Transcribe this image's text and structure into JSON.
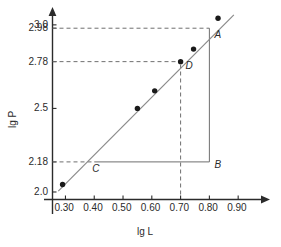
{
  "chart_data": {
    "type": "scatter",
    "title": "",
    "xlabel": "lg L",
    "ylabel": "lg P",
    "xlim": [
      0.255,
      0.955
    ],
    "ylim": [
      1.955,
      3.065
    ],
    "grid": false,
    "legend": null,
    "xticks": [
      "0.30",
      "0.40",
      "0.50",
      "0.60",
      "0.70",
      "0.80",
      "0.90"
    ],
    "xtick_values": [
      0.3,
      0.4,
      0.5,
      0.6,
      0.7,
      0.8,
      0.9
    ],
    "yticks": [
      "2.0",
      "2.18",
      "2.5",
      "2.78",
      "2.98",
      "3.0"
    ],
    "ytick_values": [
      2.0,
      2.18,
      2.5,
      2.78,
      2.98,
      3.0
    ],
    "points": [
      {
        "x": 0.29,
        "y": 2.045
      },
      {
        "x": 0.55,
        "y": 2.5
      },
      {
        "x": 0.61,
        "y": 2.605
      },
      {
        "x": 0.7,
        "y": 2.78
      },
      {
        "x": 0.745,
        "y": 2.855
      },
      {
        "x": 0.83,
        "y": 3.04
      }
    ],
    "fit_line": {
      "x0": 0.275,
      "y0": 2.005,
      "x1": 0.885,
      "y1": 3.06
    },
    "annotations": [
      {
        "label": "A",
        "x": 0.8,
        "y": 2.98
      },
      {
        "label": "B",
        "x": 0.8,
        "y": 2.18
      },
      {
        "label": "C",
        "x": 0.4,
        "y": 2.18
      },
      {
        "label": "D",
        "x": 0.7,
        "y": 2.78
      }
    ],
    "guides": [
      {
        "name": "dashed-hline-298",
        "from": [
          0.255,
          2.98
        ],
        "to": [
          0.8,
          2.98
        ],
        "style": "dashed"
      },
      {
        "name": "dashed-hline-278",
        "from": [
          0.255,
          2.78
        ],
        "to": [
          0.7,
          2.78
        ],
        "style": "dashed"
      },
      {
        "name": "dashed-hline-218",
        "from": [
          0.255,
          2.18
        ],
        "to": [
          0.4,
          2.18
        ],
        "style": "dashed"
      },
      {
        "name": "dashed-vline-070",
        "from": [
          0.7,
          1.985
        ],
        "to": [
          0.7,
          2.78
        ],
        "style": "dashed"
      },
      {
        "name": "solid-hline-CB",
        "from": [
          0.4,
          2.18
        ],
        "to": [
          0.8,
          2.18
        ],
        "style": "solid"
      },
      {
        "name": "solid-vline-BA",
        "from": [
          0.8,
          2.18
        ],
        "to": [
          0.8,
          2.98
        ],
        "style": "solid"
      }
    ]
  },
  "colors": {
    "axis": "#2b2b2b",
    "point": "#1a1a1a",
    "fit_line": "#8a8a8a",
    "guide": "#6f6f6f",
    "text": "#2b2b2b",
    "background": "#ffffff"
  }
}
